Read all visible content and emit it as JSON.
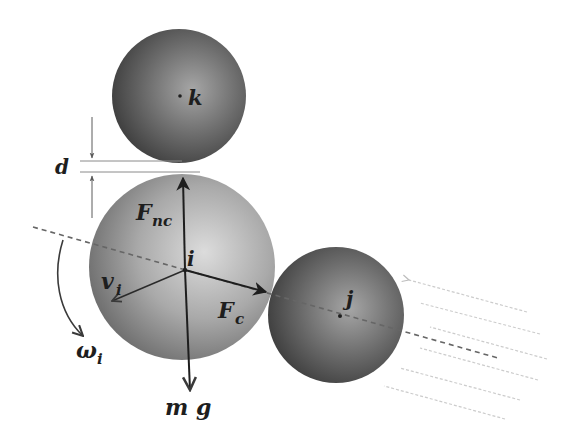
{
  "diagram": {
    "type": "particle-contact-forces",
    "colors": {
      "background": "#ffffff",
      "sphere_i_light": "#d4d4d4",
      "sphere_i_dark": "#6a6a6a",
      "sphere_dark_light": "#a8a8a8",
      "sphere_dark_dark": "#3c3c3c",
      "arrow": "#1e1e1e",
      "dashed_line": "#6a6a6a",
      "flow_lines": "#cfcfcf"
    },
    "particles": [
      {
        "id": "k",
        "label": "k",
        "cx": 179,
        "cy": 96,
        "r": 67
      },
      {
        "id": "i",
        "label": "i",
        "cx": 182,
        "cy": 267,
        "r": 93
      },
      {
        "id": "j",
        "label": "j",
        "cx": 336,
        "cy": 315,
        "r": 68
      }
    ],
    "labels": {
      "gap": "d",
      "normal_force_main": "F",
      "normal_force_sub": "nc",
      "contact_force_main": "F",
      "contact_force_sub": "c",
      "velocity_main": "v",
      "velocity_sub": "i",
      "angular_velocity_main": "ω",
      "angular_velocity_sub": "i",
      "gravity": "m g",
      "particle_i": "i",
      "particle_j": "j",
      "particle_k": "k"
    },
    "vectors": [
      {
        "name": "F_nc",
        "from": [
          185,
          270
        ],
        "to": [
          183,
          176
        ],
        "direction": "up"
      },
      {
        "name": "F_c",
        "from": [
          185,
          270
        ],
        "to": [
          268,
          293
        ],
        "direction": "toward j"
      },
      {
        "name": "v_i",
        "from": [
          185,
          270
        ],
        "to": [
          111,
          302
        ],
        "direction": "lower-left"
      },
      {
        "name": "mg",
        "from": [
          185,
          270
        ],
        "to": [
          190,
          392
        ],
        "direction": "down"
      }
    ]
  }
}
